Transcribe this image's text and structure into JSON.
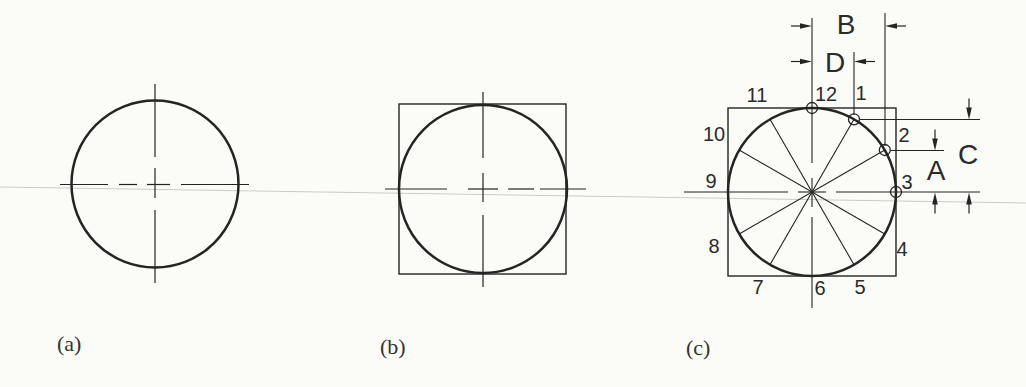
{
  "page": {
    "background": "#fbfbf8",
    "ink_color": "#242424",
    "scan_line_color": "#cbcbc6"
  },
  "figure_a": {
    "caption": "(a)"
  },
  "figure_b": {
    "caption": "(b)"
  },
  "figure_c": {
    "caption": "(c)",
    "clock_labels": [
      "1",
      "2",
      "3",
      "4",
      "5",
      "6",
      "7",
      "8",
      "9",
      "10",
      "11",
      "12"
    ],
    "dimension_labels": {
      "a": "A",
      "b": "B",
      "c": "C",
      "d": "D"
    }
  }
}
